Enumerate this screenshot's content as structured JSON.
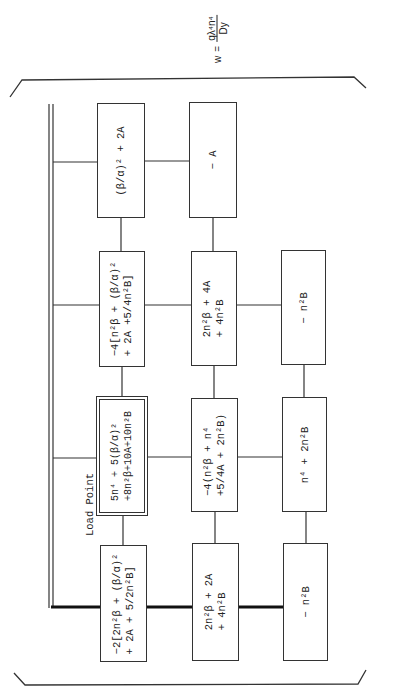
{
  "formula": {
    "lhs": "w",
    "equals": "=",
    "numerator": "qλ⁴n⁴",
    "denominator": "Dy"
  },
  "load_point_label": "Load Point",
  "grid": {
    "rows": [
      {
        "cells": [
          {
            "lines": [
              "(β/α)² + 2A"
            ]
          },
          {
            "lines": [
              "− A"
            ]
          }
        ]
      },
      {
        "cells": [
          {
            "lines": [
              "−4[n²β + (β/α)²",
              "+ 2A  +5/4n²B]"
            ]
          },
          {
            "lines": [
              "2n²β + 4A",
              "+ 4n²B"
            ]
          },
          {
            "lines": [
              "− n²B"
            ]
          }
        ]
      },
      {
        "cells": [
          {
            "lines": [
              "5n⁴ + 5(β/α)²",
              "+8n²β+10A+10n²B"
            ],
            "load_point": true
          },
          {
            "lines": [
              "−4(n²β + n⁴",
              "+5/4A + 2n²B)"
            ]
          },
          {
            "lines": [
              "n⁴ + 2n²B"
            ]
          }
        ]
      },
      {
        "cells": [
          {
            "lines": [
              "−2[2n²β + (β/α)²",
              "+ 2A + 5/2n²B]"
            ]
          },
          {
            "lines": [
              "2n²β + 2A",
              "+ 4n²B"
            ]
          },
          {
            "lines": [
              "− n²B"
            ]
          }
        ]
      }
    ]
  },
  "colors": {
    "ink": "#333333",
    "background": "#ffffff"
  }
}
